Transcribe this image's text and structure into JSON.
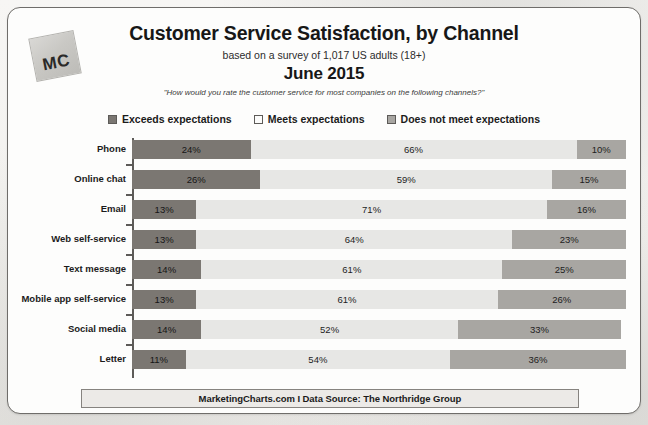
{
  "logo": {
    "text": "MC",
    "name": "marketingcharts-logo"
  },
  "header": {
    "title": "Customer Service Satisfaction, by Channel",
    "subtitle": "based on a survey of 1,017 US adults (18+)",
    "period": "June 2015",
    "question": "\"How would you rate the customer service for most companies on the following channels?\""
  },
  "footer": {
    "text": "MarketingCharts.com I Data Source: The Northridge Group"
  },
  "colors": {
    "exceeds": "#7b7772",
    "meets": "#e7e7e5",
    "does_not_meet": "#a8a6a2",
    "axis": "#5d5b58",
    "border": "#6f6d6a",
    "page_background": "#f4f3f1",
    "card_background": "#fdfdfc"
  },
  "chart_data": {
    "type": "bar",
    "orientation": "horizontal",
    "stacked": true,
    "normalized_100": true,
    "title": "Customer Service Satisfaction, by Channel",
    "subtitle": "based on a survey of 1,017 US adults (18+)",
    "period": "June 2015",
    "annotation": "\"How would you rate the customer service for most companies on the following channels?\"",
    "source": "MarketingCharts.com I Data Source: The Northridge Group",
    "xlabel": "",
    "ylabel": "",
    "xlim": [
      0,
      100
    ],
    "grid": false,
    "legend_position": "top",
    "value_suffix": "%",
    "categories": [
      "Phone",
      "Online chat",
      "Email",
      "Web self-service",
      "Text message",
      "Mobile app self-service",
      "Social media",
      "Letter"
    ],
    "series": [
      {
        "name": "Exceeds expectations",
        "color": "#7b7772",
        "values": [
          24,
          26,
          13,
          13,
          14,
          13,
          14,
          11
        ]
      },
      {
        "name": "Meets expectations",
        "color": "#e7e7e5",
        "values": [
          66,
          59,
          71,
          64,
          61,
          61,
          52,
          54
        ]
      },
      {
        "name": "Does not meet expectations",
        "color": "#a8a6a2",
        "values": [
          10,
          15,
          16,
          23,
          25,
          26,
          33,
          36
        ]
      }
    ],
    "labels": [
      {
        "category": "Phone",
        "exceeds": "24%",
        "meets": "66%",
        "does_not_meet": "10%"
      },
      {
        "category": "Online chat",
        "exceeds": "26%",
        "meets": "59%",
        "does_not_meet": "15%"
      },
      {
        "category": "Email",
        "exceeds": "13%",
        "meets": "71%",
        "does_not_meet": "16%"
      },
      {
        "category": "Web self-service",
        "exceeds": "13%",
        "meets": "64%",
        "does_not_meet": "23%"
      },
      {
        "category": "Text message",
        "exceeds": "14%",
        "meets": "61%",
        "does_not_meet": "25%"
      },
      {
        "category": "Mobile app self-service",
        "exceeds": "13%",
        "meets": "61%",
        "does_not_meet": "26%"
      },
      {
        "category": "Social media",
        "exceeds": "14%",
        "meets": "52%",
        "does_not_meet": "33%"
      },
      {
        "category": "Letter",
        "exceeds": "11%",
        "meets": "54%",
        "does_not_meet": "36%"
      }
    ]
  }
}
